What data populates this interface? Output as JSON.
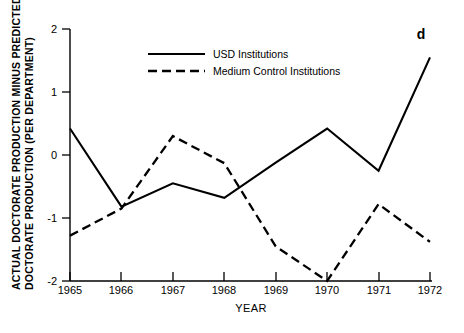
{
  "panel": {
    "label": "d"
  },
  "chart_data": {
    "type": "line",
    "title": "",
    "subtitle": "",
    "xlabel": "YEAR",
    "ylabel": "ACTUAL DOCTORATE PRODUCTION MINUS PREDICTED DOCTORATE PRODUCTION (PER DEPARTMENT)",
    "ylabel_line1": "ACTUAL DOCTORATE PRODUCTION MINUS PREDICTED",
    "ylabel_line2": "DOCTORATE PRODUCTION (PER DEPARTMENT)",
    "x": [
      1965,
      1966,
      1967,
      1968,
      1969,
      1970,
      1971,
      1972
    ],
    "categories": [
      "1965",
      "1966",
      "1967",
      "1968",
      "1969",
      "1970",
      "1971",
      "1972"
    ],
    "xtick_labels": [
      "1965",
      "1966",
      "1967",
      "1968",
      "1969",
      "1970",
      "1971",
      "1972"
    ],
    "ytick_labels": [
      "2",
      "1",
      "0",
      "-1",
      "-2"
    ],
    "yticks": [
      2,
      1,
      0,
      -1,
      -2
    ],
    "xlim": [
      1965,
      1972
    ],
    "ylim": [
      -2,
      2
    ],
    "grid": false,
    "legend_position": "top-center",
    "series": [
      {
        "name": "USD Institutions",
        "style": "solid",
        "color": "#000000",
        "values": [
          0.42,
          -0.82,
          -0.45,
          -0.68,
          -0.12,
          0.42,
          -0.25,
          1.55
        ]
      },
      {
        "name": "Medium Control Institutions",
        "style": "dashed",
        "color": "#000000",
        "values": [
          -1.28,
          -0.85,
          0.3,
          -0.13,
          -1.45,
          -2.0,
          -0.78,
          -1.38
        ]
      }
    ]
  }
}
